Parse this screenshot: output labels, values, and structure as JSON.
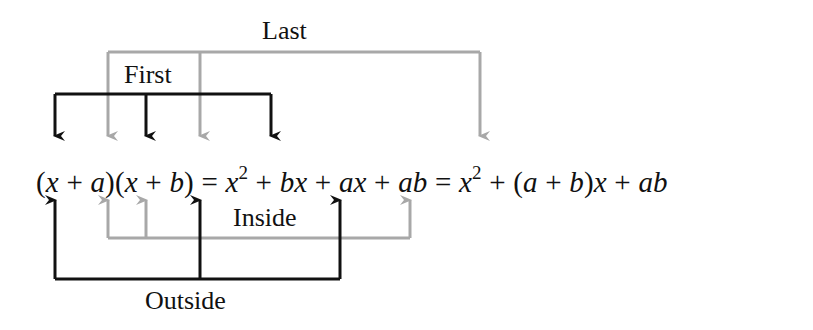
{
  "diagram": {
    "labels": {
      "last": "Last",
      "first": "First",
      "inside": "Inside",
      "outside": "Outside"
    },
    "equation": {
      "full": "(x + a)(x + b) = x^2 + bx + ax + ab = x^2 + (a + b)x + ab",
      "parts": [
        "(",
        "x",
        " + ",
        "a",
        ")(",
        "x",
        " + ",
        "b",
        ") = ",
        "x",
        "2",
        " + ",
        "bx",
        " + ",
        "ax",
        " + ",
        "ab",
        " = ",
        "x",
        "2",
        " + (",
        "a",
        " + ",
        "b",
        ")",
        "x",
        " + ",
        "ab"
      ]
    },
    "colors": {
      "first_outside": "#111111",
      "last_inside": "#a8a8a8"
    },
    "connections": [
      {
        "name": "First",
        "color": "black",
        "from": [
          "x (first factor)",
          "x (second factor)"
        ],
        "to": "x^2"
      },
      {
        "name": "Last",
        "color": "gray",
        "from": [
          "a",
          "b"
        ],
        "to": "ab"
      },
      {
        "name": "Inside",
        "color": "gray",
        "from": [
          "a",
          "x (second factor)"
        ],
        "to": "ax"
      },
      {
        "name": "Outside",
        "color": "black",
        "from": [
          "x (first factor)",
          "b"
        ],
        "to": "bx"
      }
    ]
  }
}
